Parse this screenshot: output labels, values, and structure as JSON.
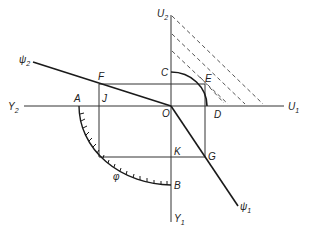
{
  "diagram": {
    "type": "geometric-construction",
    "axes": {
      "vertical_top": {
        "main": "U",
        "sub": "2"
      },
      "vertical_bottom": {
        "main": "Y",
        "sub": "1"
      },
      "horizontal_right": {
        "main": "U",
        "sub": "1"
      },
      "horizontal_left": {
        "main": "Y",
        "sub": "2"
      }
    },
    "lines": {
      "psi2": {
        "main": "ψ",
        "sub": "2"
      },
      "psi1": {
        "main": "ψ",
        "sub": "1"
      }
    },
    "points": {
      "A": "A",
      "B": "B",
      "C": "C",
      "D": "D",
      "E": "E",
      "F": "F",
      "G": "G",
      "J": "J",
      "K": "K",
      "O": "O"
    },
    "angle_label": "φ",
    "colors": {
      "line": "#1a1a1a",
      "thin": "#444444",
      "dashed": "#555555"
    }
  }
}
